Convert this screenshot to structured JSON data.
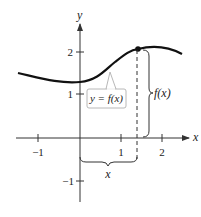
{
  "figure": {
    "x_axis_label": "x",
    "y_axis_label": "y",
    "x_ticks": [
      {
        "value": -1,
        "label": "−1"
      },
      {
        "value": 1,
        "label": "1"
      },
      {
        "value": 2,
        "label": "2"
      }
    ],
    "y_ticks": [
      {
        "value": -1,
        "label": "−1"
      },
      {
        "value": 1,
        "label": "1"
      },
      {
        "value": 2,
        "label": "2"
      }
    ],
    "curve_label": "y = f(x)",
    "height_brace_label": "f(x)",
    "width_brace_label": "x",
    "colors": {
      "curve": "#111111",
      "axes": "#333333",
      "label_box_border": "#b8b8b8"
    }
  }
}
